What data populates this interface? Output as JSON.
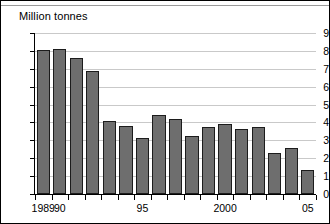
{
  "figure": {
    "title": "Million tonnes"
  },
  "chart_data": {
    "type": "bar",
    "title": "Million tonnes",
    "xlabel": "",
    "ylabel": "Million tonnes",
    "ylim": [
      0,
      9
    ],
    "ytick_labels": [
      "0",
      "1",
      "2",
      "3",
      "4",
      "5",
      "6",
      "7",
      "8",
      "9"
    ],
    "yticks": [
      0,
      1,
      2,
      3,
      4,
      5,
      6,
      7,
      8,
      9
    ],
    "grid": true,
    "legend": false,
    "bar_color": "#6e6e6e",
    "bar_edge_color": "#1c1c1c",
    "gridline_color": "#c9c9c9",
    "axis_color": "#000000",
    "categories": [
      "1989",
      "1990",
      "1991",
      "1992",
      "1993",
      "1994",
      "1995",
      "1996",
      "1997",
      "1998",
      "1999",
      "2000",
      "2001",
      "2002",
      "2003",
      "2004",
      "2005"
    ],
    "values": [
      8.05,
      8.1,
      7.6,
      6.9,
      4.1,
      3.8,
      3.15,
      4.4,
      4.2,
      3.25,
      3.75,
      3.9,
      3.65,
      3.75,
      2.3,
      2.55,
      1.35
    ],
    "visible_xtick_labels": [
      {
        "category": "1989",
        "label": "1989"
      },
      {
        "category": "1990",
        "label": "90"
      },
      {
        "category": "1995",
        "label": "95"
      },
      {
        "category": "2000",
        "label": "2000"
      },
      {
        "category": "2005",
        "label": "05"
      }
    ]
  }
}
